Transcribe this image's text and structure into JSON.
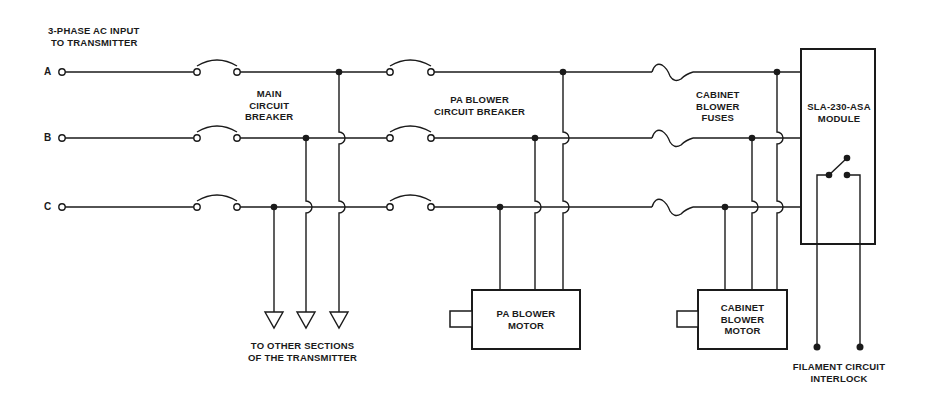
{
  "diagram": {
    "type": "electrical-schematic",
    "title": [
      "3-PHASE AC INPUT",
      "TO TRANSMITTER"
    ],
    "phases": [
      {
        "label": "A",
        "y": 72
      },
      {
        "label": "B",
        "y": 138
      },
      {
        "label": "C",
        "y": 207
      }
    ],
    "main_breaker": {
      "label": [
        "MAIN",
        "CIRCUIT",
        "BREAKER"
      ]
    },
    "pa_breaker": {
      "label": [
        "PA BLOWER",
        "CIRCUIT BREAKER"
      ]
    },
    "cabinet_fuses": {
      "label": [
        "CABINET",
        "BLOWER",
        "FUSES"
      ]
    },
    "module": {
      "label": [
        "SLA-230-ASA",
        "MODULE"
      ]
    },
    "other_sections": {
      "label": [
        "TO OTHER SECTIONS",
        "OF THE TRANSMITTER"
      ]
    },
    "pa_motor": {
      "label": [
        "PA BLOWER",
        "MOTOR"
      ]
    },
    "cabinet_motor": {
      "label": [
        "CABINET",
        "BLOWER",
        "MOTOR"
      ]
    },
    "interlock": {
      "label": [
        "FILAMENT CIRCUIT",
        "INTERLOCK"
      ]
    },
    "colors": {
      "ink": "#1a1a1a",
      "background": "#ffffff"
    }
  }
}
